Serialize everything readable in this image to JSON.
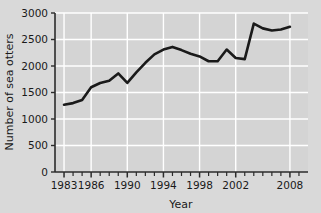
{
  "chart_data": {
    "type": "line",
    "title": "",
    "xlabel": "Year",
    "ylabel": "Number of sea otters",
    "xlim": [
      1982,
      2010
    ],
    "ylim": [
      0,
      3000
    ],
    "grid": true,
    "legend": null,
    "yticks": [
      0,
      500,
      1000,
      1500,
      2000,
      2500,
      3000
    ],
    "ytick_labels": [
      "0",
      "500",
      "1000",
      "1500",
      "2000",
      "2500",
      "3000"
    ],
    "xticks": [
      1983,
      1986,
      1990,
      1994,
      1998,
      2002,
      2008
    ],
    "xtick_labels": [
      "1983",
      "1986",
      "1990",
      "1994",
      "1998",
      "2002",
      "2008"
    ],
    "xminor_step": 1,
    "line_color": "#1a1a1a",
    "line_width": 2.6,
    "plot_background": "#d4d4d4",
    "grid_color": "#ffffff",
    "axis_color": "#2b2b2b",
    "x": [
      1983,
      1984,
      1985,
      1986,
      1987,
      1988,
      1989,
      1990,
      1991,
      1992,
      1993,
      1994,
      1995,
      1996,
      1997,
      1998,
      1999,
      2000,
      2001,
      2002,
      2003,
      2004,
      2005,
      2006,
      2007,
      2008
    ],
    "values": [
      1270,
      1300,
      1360,
      1600,
      1680,
      1720,
      1860,
      1680,
      1880,
      2060,
      2220,
      2310,
      2360,
      2300,
      2230,
      2180,
      2090,
      2090,
      2310,
      2150,
      2130,
      2800,
      2710,
      2670,
      2690,
      2740
    ],
    "series": [
      {
        "name": "Number of sea otters",
        "values": [
          1270,
          1300,
          1360,
          1600,
          1680,
          1720,
          1860,
          1680,
          1880,
          2060,
          2220,
          2310,
          2360,
          2300,
          2230,
          2180,
          2090,
          2090,
          2310,
          2150,
          2130,
          2800,
          2710,
          2670,
          2690,
          2740
        ]
      }
    ]
  },
  "axes": {
    "x_title": "Year",
    "y_title": "Number of sea otters"
  },
  "ticks": {
    "y": [
      "3000",
      "2500",
      "2000",
      "1500",
      "1000",
      "500",
      "0"
    ],
    "x": [
      "1983",
      "1986",
      "1990",
      "1994",
      "1998",
      "2002",
      "2008"
    ]
  }
}
